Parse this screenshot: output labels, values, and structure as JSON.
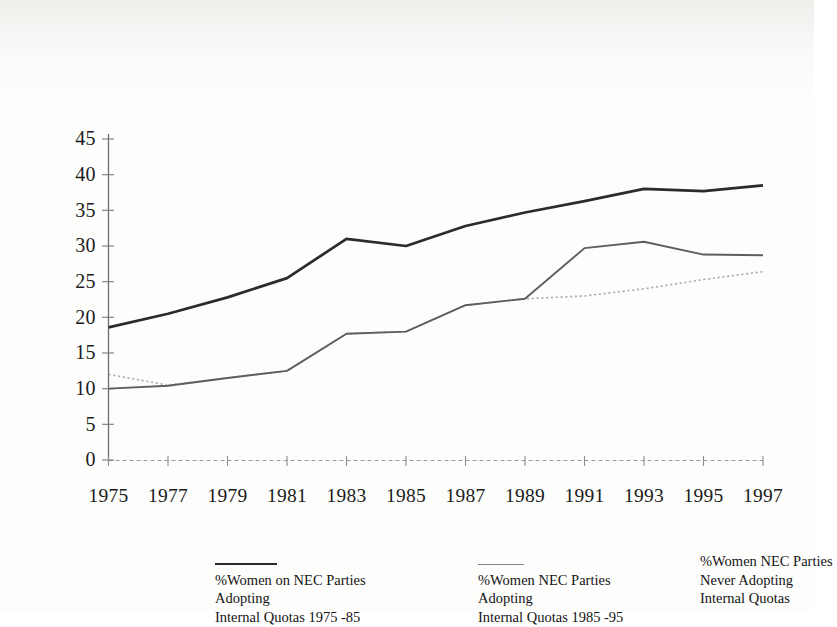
{
  "chart_data": {
    "type": "line",
    "title": "",
    "subtitle": "",
    "xlabel": "",
    "ylabel": "",
    "categories": [
      "1975",
      "1977",
      "1979",
      "1981",
      "1983",
      "1985",
      "1987",
      "1989",
      "1991",
      "1993",
      "1995",
      "1997"
    ],
    "x": [
      1975,
      1977,
      1979,
      1981,
      1983,
      1985,
      1987,
      1989,
      1991,
      1993,
      1995,
      1997
    ],
    "ylim": [
      0,
      45
    ],
    "xlim": [
      1975,
      1997
    ],
    "yticks": [
      0,
      5,
      10,
      15,
      20,
      25,
      30,
      35,
      40,
      45
    ],
    "ytick_labels": [
      "0",
      "5",
      "10",
      "15",
      "20",
      "25",
      "30",
      "35",
      "40",
      "45"
    ],
    "grid": false,
    "legend_position": "bottom",
    "series": [
      {
        "name": "%Women on NEC Parties Adopting Internal Quotas 1975 -85",
        "style": "solid-heavy",
        "color": "#2b2b2b",
        "values": [
          18.6,
          20.5,
          22.8,
          25.5,
          31.0,
          30.0,
          32.8,
          34.7,
          36.3,
          38.0,
          37.7,
          38.5
        ]
      },
      {
        "name": "%Women NEC Parties Adopting Internal Quotas 1985 -95",
        "style": "solid-light",
        "color": "#5e5e5e",
        "values": [
          10.0,
          10.4,
          11.5,
          12.5,
          17.7,
          18.0,
          21.7,
          22.6,
          29.7,
          30.6,
          28.8,
          28.7
        ]
      },
      {
        "name": "%Women NEC Parties Never Adopting Internal Quotas",
        "style": "dotted-faint",
        "color": "#9a9a9a",
        "values": [
          12.0,
          10.5,
          11.5,
          12.5,
          17.7,
          18.0,
          21.7,
          22.6,
          23.0,
          24.0,
          25.3,
          26.4
        ]
      }
    ]
  },
  "legend": [
    {
      "marker": "solid-heavy-line",
      "line1": "%Women on NEC Parties",
      "line2": "Adopting",
      "line3": "Internal Quotas 1975 -85"
    },
    {
      "marker": "solid-light-line",
      "line1": "%Women NEC Parties",
      "line2": "Adopting",
      "line3": "Internal Quotas 1985 -95"
    },
    {
      "marker": "none",
      "line1": "%Women NEC Parties",
      "line2": "Never Adopting",
      "line3": "Internal Quotas"
    }
  ]
}
